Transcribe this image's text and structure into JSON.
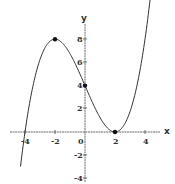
{
  "chart_data": {
    "type": "line",
    "title": "",
    "xlabel": "x",
    "ylabel": "y",
    "xlim": [
      -5,
      5
    ],
    "ylim": [
      -4,
      9
    ],
    "x_ticks": [
      -4,
      -2,
      0,
      2,
      4
    ],
    "x_tick_labels": [
      "-4",
      "-2",
      "0",
      "2",
      "4"
    ],
    "y_ticks": [
      -4,
      -2,
      2,
      4,
      6,
      8
    ],
    "y_tick_labels": [
      "-4",
      "-2",
      "2",
      "4",
      "6",
      "8"
    ],
    "grid": false,
    "legend": "none",
    "series": [
      {
        "name": "f(x) = (x-2)^2 (x+4) / 4",
        "x": [
          -4.3,
          -4,
          -3,
          -2,
          -1,
          0,
          1,
          2,
          3,
          4
        ],
        "y": [
          -3.1,
          0,
          6.25,
          8,
          6.75,
          4,
          1.25,
          0,
          1.75,
          8
        ]
      }
    ],
    "marked_points": [
      {
        "x": -2,
        "y": 8
      },
      {
        "x": 0,
        "y": 4
      },
      {
        "x": 2,
        "y": 0
      }
    ]
  }
}
